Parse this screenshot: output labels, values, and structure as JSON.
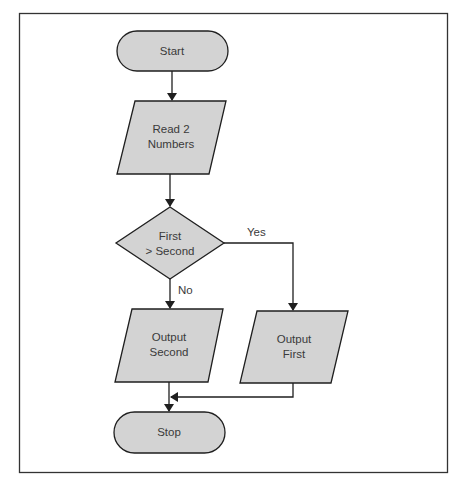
{
  "flowchart": {
    "nodes": {
      "start": {
        "type": "terminal",
        "text": "Start"
      },
      "read": {
        "type": "input-output",
        "line1": "Read 2",
        "line2": "Numbers"
      },
      "decision": {
        "type": "decision",
        "line1": "First",
        "line2": "> Second"
      },
      "output_second": {
        "type": "input-output",
        "line1": "Output",
        "line2": "Second"
      },
      "output_first": {
        "type": "input-output",
        "line1": "Output",
        "line2": "First"
      },
      "stop": {
        "type": "terminal",
        "text": "Stop"
      }
    },
    "edges": {
      "yes": {
        "from": "decision",
        "to": "output_first",
        "label": "Yes"
      },
      "no": {
        "from": "decision",
        "to": "output_second",
        "label": "No"
      }
    },
    "colors": {
      "shape_fill": "#d3d3d3",
      "stroke": "#1f1f1f",
      "text": "#3a3a3a",
      "background": "#ffffff"
    }
  }
}
